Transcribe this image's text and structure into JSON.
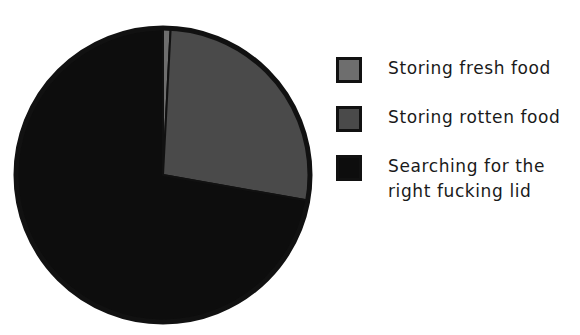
{
  "chart_data": {
    "type": "pie",
    "title": "",
    "subtitle": "",
    "xlabel": "",
    "ylabel": "",
    "grid": false,
    "legend_position": "right",
    "start_angle_deg": 0,
    "direction": "clockwise",
    "categories": [
      "Storing fresh food",
      "Storing rotten food",
      "Searching for the right fucking lid"
    ],
    "values": [
      0.8,
      27.0,
      72.2
    ],
    "value_unit": "percent",
    "slices": [
      {
        "label": "Storing fresh food",
        "label_lines": [
          "Storing fresh food"
        ],
        "value": 0.8,
        "angle_deg": 3,
        "color": "#6e6e6e",
        "edge_color": "#111111"
      },
      {
        "label": "Storing rotten food",
        "label_lines": [
          "Storing rotten food"
        ],
        "value": 27.0,
        "angle_deg": 97,
        "color": "#4a4a4a",
        "edge_color": "#111111"
      },
      {
        "label": "Searching for the right fucking lid",
        "label_lines": [
          "Searching for the",
          "right fucking lid"
        ],
        "value": 72.2,
        "angle_deg": 260,
        "color": "#0d0d0d",
        "edge_color": "#111111"
      }
    ],
    "geometry": {
      "center_x": 163,
      "center_y": 175,
      "radius": 147
    },
    "colors": {
      "background": "#ffffff",
      "text": "#1a1a1a",
      "outline": "#111111",
      "slice_fresh": "#6e6e6e",
      "slice_rotten": "#4a4a4a",
      "slice_searching": "#0d0d0d"
    }
  },
  "legend": {
    "entries": [
      {
        "label": "Storing fresh food",
        "color": "#6e6e6e"
      },
      {
        "label": "Storing rotten food",
        "color": "#4a4a4a"
      },
      {
        "label": "Searching for the\nright fucking lid",
        "color": "#0d0d0d"
      }
    ]
  }
}
